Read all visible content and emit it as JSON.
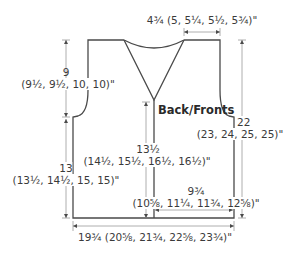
{
  "diagram": {
    "title": "Back/Fronts",
    "colors": {
      "outline": "#4a4a4a",
      "dimension_line": "#9a9a9a",
      "text": "#3a3a3a"
    },
    "measurements": {
      "shoulder_width": "4¾ (5, 5¼, 5½, 5¾)\"",
      "armhole_depth_main": "9",
      "armhole_depth_sizes": "(9½, 9½, 10, 10)\"",
      "total_length_main": "22",
      "total_length_sizes": "(23, 24, 25, 25)\"",
      "front_length_to_neck_main": "13½",
      "front_length_to_neck_sizes": "(14½, 15½, 16½, 16½)\"",
      "side_length_main": "13",
      "side_length_sizes": "(13½, 14½, 15, 15)\"",
      "front_width_main": "9¾",
      "front_width_sizes": "(10⅝, 11¼, 11¾, 12⅝)\"",
      "back_width": "19¾ (20⅝, 21¾, 22⅝, 23¾)\""
    }
  }
}
